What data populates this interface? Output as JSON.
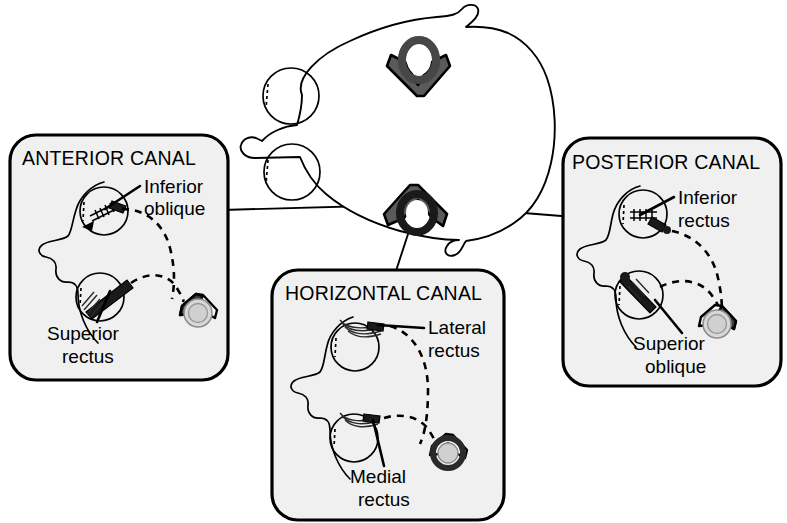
{
  "figure": {
    "title_hidden": "",
    "background_color": "#ffffff",
    "panel_fill": "#f0f0f0",
    "stroke_color": "#000000"
  },
  "center": {
    "name": "head-top-view",
    "description": "Top-down schematic of a head with two eyes and two semicircular canal icons",
    "canals": [
      {
        "id": "anterior-posterior-canal-icon",
        "orientation": "wings-down"
      },
      {
        "id": "horizontal-canal-icon",
        "orientation": "wings-up"
      }
    ]
  },
  "panels": [
    {
      "id": "anterior-canal",
      "title": "ANTERIOR CANAL",
      "labels": [
        {
          "id": "inferior-oblique",
          "line1": "Inferior",
          "line2": "oblique"
        },
        {
          "id": "superior-rectus",
          "line1": "Superior",
          "line2": "rectus"
        }
      ],
      "canal_icon": {
        "dark_side": "left"
      }
    },
    {
      "id": "horizontal-canal",
      "title": "HORIZONTAL CANAL",
      "labels": [
        {
          "id": "lateral-rectus",
          "line1": "Lateral",
          "line2": "rectus"
        },
        {
          "id": "medial-rectus",
          "line1": "Medial",
          "line2": "rectus"
        }
      ],
      "canal_icon": {
        "dark_side": "ring"
      }
    },
    {
      "id": "posterior-canal",
      "title": "POSTERIOR CANAL",
      "labels": [
        {
          "id": "inferior-rectus",
          "line1": "Inferior",
          "line2": "rectus"
        },
        {
          "id": "superior-oblique",
          "line1": "Superior",
          "line2": "oblique"
        }
      ],
      "canal_icon": {
        "dark_side": "right"
      }
    }
  ]
}
